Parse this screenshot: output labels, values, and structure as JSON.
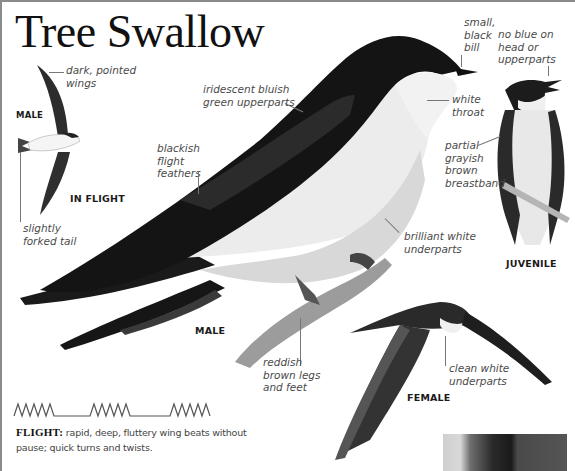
{
  "title": "Tree Swallow",
  "labels": {
    "dark_pointed_wings": "dark, pointed\nwings",
    "slightly_forked_tail": "slightly\nforked tail",
    "iridescent_upperparts": "iridescent bluish\ngreen upperparts",
    "blackish_flight_feathers": "blackish\nflight\nfeathers",
    "small_black_bill": "small,\nblack\nbill",
    "white_throat": "white\nthroat",
    "no_blue": "no blue on\nhead or\nupperparts",
    "partial_breastband": "partial\ngrayish\nbrown\nbreastband",
    "brilliant_white_underparts": "brilliant white\nunderparts",
    "reddish_brown_legs": "reddish\nbrown legs\nand feet",
    "clean_white_underparts": "clean white\nunderparts"
  },
  "captions": {
    "flight_male": "MALE",
    "in_flight": "IN FLIGHT",
    "male": "MALE",
    "juvenile": "JUVENILE",
    "female": "FEMALE"
  },
  "flight": {
    "heading": "FLIGHT:",
    "description": " rapid, deep, fluttery wing beats without pause; quick turns and twists."
  },
  "illustrations": [
    {
      "name": "male-in-flight",
      "type": "bird silhouette"
    },
    {
      "name": "male-perched",
      "type": "bird photo"
    },
    {
      "name": "juvenile-perched",
      "type": "bird photo"
    },
    {
      "name": "female-in-flight",
      "type": "bird photo"
    },
    {
      "name": "habitat-inset",
      "type": "photo"
    }
  ],
  "colors": {
    "label_text": "#4a4a4a",
    "caption_text": "#1a1a1a",
    "border": "#8a8a8a"
  }
}
